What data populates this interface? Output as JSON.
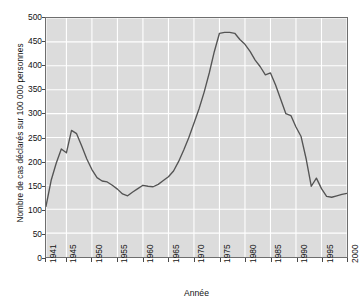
{
  "chart_data": {
    "type": "line",
    "title": "",
    "xlabel": "Année",
    "ylabel": "Nombre de cas déclarés sur 100 000 personnes",
    "xlim": [
      1941,
      2000
    ],
    "ylim": [
      0,
      500
    ],
    "grid": true,
    "legend": null,
    "x_ticks": [
      "1941",
      "1945",
      "1950",
      "1955",
      "1960",
      "1965",
      "1970",
      "1975",
      "1980",
      "1985",
      "1990",
      "1995",
      "2000"
    ],
    "x_tick_values": [
      1941,
      1945,
      1950,
      1955,
      1960,
      1965,
      1970,
      1975,
      1980,
      1985,
      1990,
      1995,
      2000
    ],
    "y_ticks": [
      "0",
      "50",
      "100",
      "150",
      "200",
      "250",
      "300",
      "350",
      "400",
      "450",
      "500"
    ],
    "y_tick_values": [
      0,
      50,
      100,
      150,
      200,
      250,
      300,
      350,
      400,
      450,
      500
    ],
    "series": [
      {
        "name": "Cas déclarés",
        "color": "#545454",
        "x": [
          1941,
          1942,
          1943,
          1944,
          1945,
          1946,
          1947,
          1948,
          1949,
          1950,
          1951,
          1952,
          1953,
          1954,
          1955,
          1956,
          1957,
          1958,
          1959,
          1960,
          1961,
          1962,
          1963,
          1964,
          1965,
          1966,
          1967,
          1968,
          1969,
          1970,
          1971,
          1972,
          1973,
          1974,
          1975,
          1976,
          1977,
          1978,
          1979,
          1980,
          1981,
          1982,
          1983,
          1984,
          1985,
          1986,
          1987,
          1988,
          1989,
          1990,
          1991,
          1992,
          1993,
          1994,
          1995,
          1996,
          1997,
          1998,
          1999,
          2000
        ],
        "values": [
          106,
          160,
          196,
          226,
          218,
          265,
          258,
          232,
          205,
          183,
          166,
          159,
          157,
          150,
          142,
          132,
          128,
          136,
          143,
          150,
          148,
          147,
          152,
          160,
          168,
          180,
          200,
          224,
          250,
          280,
          310,
          345,
          385,
          430,
          468,
          470,
          470,
          468,
          455,
          445,
          430,
          412,
          398,
          381,
          385,
          360,
          330,
          300,
          296,
          272,
          252,
          205,
          148,
          165,
          143,
          127,
          125,
          128,
          131,
          133
        ]
      }
    ]
  },
  "style": {
    "plot_background": "#dcdcdc",
    "grid_color": "#ffffff",
    "axis_color": "#6e6e6e",
    "line_color": "#545454",
    "page_background": "#ffffff",
    "text_color": "#111111"
  }
}
